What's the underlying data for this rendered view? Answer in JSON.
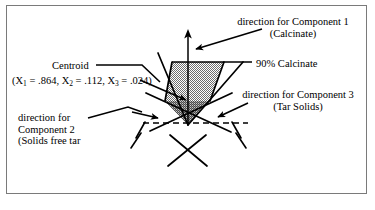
{
  "figure": {
    "border_color": "#7a7a7a",
    "background": "#ffffff",
    "ink_color": "#000000",
    "fill_light": "#b5b5b5",
    "fill_dark": "#8f8f8f"
  },
  "labels": {
    "component1": {
      "line1": "direction for Component 1",
      "line2": "(Calcinate)"
    },
    "calcinate_level": "90% Calcinate",
    "centroid": {
      "title": "Centroid",
      "coords_open": "(X",
      "x1_sub": "1",
      "x1_eq": " = .864,  X",
      "x2_sub": "2",
      "x2_eq": " = .112,  X",
      "x3_sub": "3",
      "x3_eq": " = .024)"
    },
    "component3": {
      "line1": "direction for Component 3",
      "line2": "(Tar Solids)"
    },
    "component2": {
      "line1": "direction for",
      "line2": "Component 2",
      "line3": "(Solids free tar"
    }
  }
}
